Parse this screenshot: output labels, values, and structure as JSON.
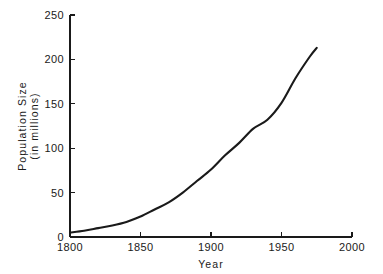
{
  "chart_data": {
    "type": "line",
    "title": "",
    "xlabel": "Year",
    "ylabel": "Population Size\n(in millions)",
    "ylabel_line1": "Population  Size",
    "ylabel_line2": "(in millions)",
    "xlim": [
      1800,
      2000
    ],
    "ylim": [
      0,
      250
    ],
    "xticks": [
      1800,
      1850,
      1900,
      1950,
      2000
    ],
    "xtick_labels": [
      "1800",
      "1850",
      "1900",
      "1950",
      "2000"
    ],
    "yticks": [
      0,
      50,
      100,
      150,
      200,
      250
    ],
    "ytick_labels": [
      "0",
      "50",
      "100",
      "150",
      "200",
      "250"
    ],
    "grid": false,
    "legend": false,
    "series": [
      {
        "name": "Population",
        "color": "#1a1a1a",
        "x": [
          1800,
          1810,
          1820,
          1830,
          1840,
          1850,
          1860,
          1870,
          1880,
          1890,
          1900,
          1910,
          1920,
          1930,
          1940,
          1950,
          1960,
          1970,
          1975
        ],
        "values": [
          5,
          7,
          10,
          13,
          17,
          23,
          31,
          39,
          50,
          63,
          76,
          92,
          106,
          122,
          132,
          151,
          179,
          203,
          213
        ]
      }
    ]
  },
  "axes": {
    "x_axis_name": "year-axis",
    "y_axis_name": "population-axis"
  }
}
